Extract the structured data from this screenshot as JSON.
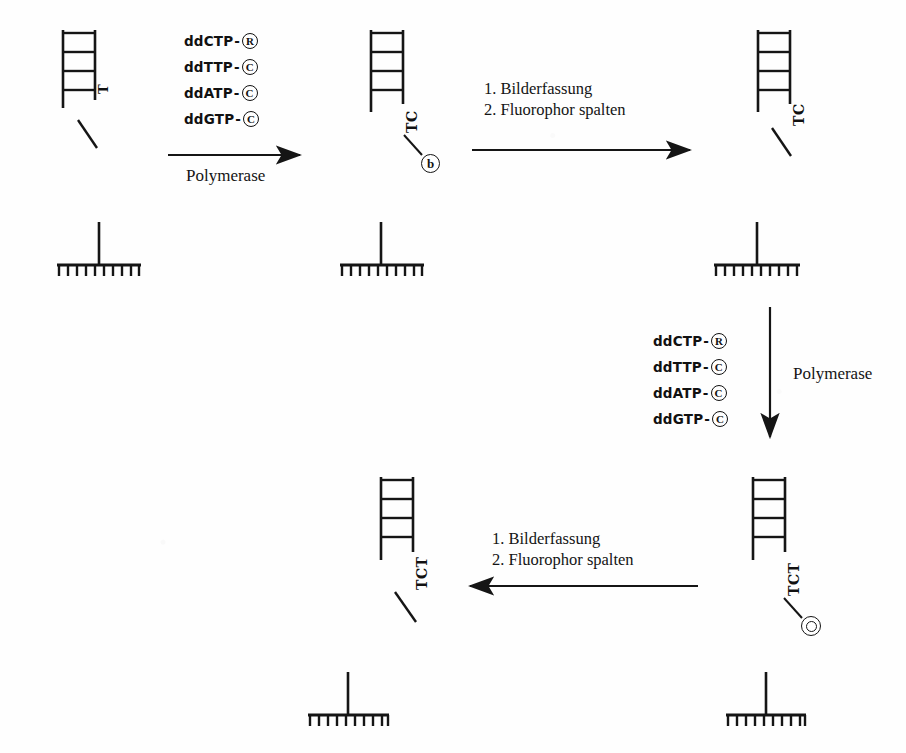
{
  "diagram": {
    "language": "de",
    "ink_color": "#151515",
    "background_color": "#fefefe"
  },
  "reagent_lists": [
    {
      "id": "reagents-top",
      "items": [
        {
          "name": "ddCTP",
          "dash": "-",
          "tag": "R"
        },
        {
          "name": "ddTTP",
          "dash": "-",
          "tag": "C"
        },
        {
          "name": "ddATP",
          "dash": "-",
          "tag": "C"
        },
        {
          "name": "ddGTP",
          "dash": "-",
          "tag": "C"
        }
      ]
    },
    {
      "id": "reagents-right",
      "items": [
        {
          "name": "ddCTP",
          "dash": "-",
          "tag": "R"
        },
        {
          "name": "ddTTP",
          "dash": "-",
          "tag": "C"
        },
        {
          "name": "ddATP",
          "dash": "-",
          "tag": "C"
        },
        {
          "name": "ddGTP",
          "dash": "-",
          "tag": "C"
        }
      ]
    }
  ],
  "arrows": {
    "polymerase_top": {
      "label": "Polymerase",
      "direction": "right"
    },
    "polymerase_right": {
      "label": "Polymerase",
      "direction": "down"
    },
    "imaging_top": {
      "line1": "1. Bilderfassung",
      "line2": "2. Fluorophor spalten",
      "direction": "right"
    },
    "imaging_bottom": {
      "line1": "1. Bilderfassung",
      "line2": "2. Fluorophor spalten",
      "direction": "left"
    }
  },
  "structures": [
    {
      "id": "struct-1",
      "position": "top-left",
      "bases": "T",
      "fluorophore": null,
      "has_tail": true
    },
    {
      "id": "struct-2",
      "position": "top-center",
      "bases": "TC",
      "fluorophore": {
        "glyph": "b",
        "style": "r"
      },
      "has_tail": false
    },
    {
      "id": "struct-3",
      "position": "top-right",
      "bases": "TC",
      "fluorophore": null,
      "has_tail": true
    },
    {
      "id": "struct-4",
      "position": "bottom-right",
      "bases": "TCT",
      "fluorophore": {
        "glyph": "O",
        "style": "o"
      },
      "has_tail": false
    },
    {
      "id": "struct-5",
      "position": "bottom-left",
      "bases": "TCT",
      "fluorophore": null,
      "has_tail": true
    }
  ],
  "combs": [
    {
      "id": "comb-1",
      "teeth": 10
    },
    {
      "id": "comb-2",
      "teeth": 11
    },
    {
      "id": "comb-3",
      "teeth": 11
    },
    {
      "id": "comb-4",
      "teeth": 10
    },
    {
      "id": "comb-5",
      "teeth": 10
    }
  ]
}
